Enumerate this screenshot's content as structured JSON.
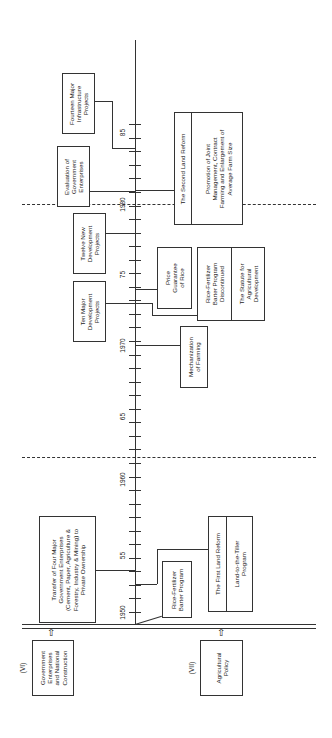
{
  "timeline": {
    "axis_labels": [
      {
        "text": "1950",
        "y": 612
      },
      {
        "text": "55",
        "y": 545
      },
      {
        "text": "1960",
        "y": 480
      },
      {
        "text": "65",
        "y": 415
      },
      {
        "text": "1970",
        "y": 346
      },
      {
        "text": "75",
        "y": 275
      },
      {
        "text": "1980",
        "y": 205
      },
      {
        "text": "85",
        "y": 133
      }
    ],
    "separator_years": [
      "1961",
      "1980"
    ]
  },
  "categories": {
    "vi": {
      "numeral": "(VI)",
      "label": "Government\nEnterprises\nand National\nConstruction"
    },
    "vii": {
      "numeral": "(VII)",
      "label": "Agricultural\nPolicy"
    }
  },
  "events_left": {
    "fourteen_projects": "Fourteen Major\nInfrastructure\nProjects",
    "evaluation": "Evaluation of\nGovernment\nEnterprises",
    "twelve_projects": "Twelve New\nDevelopment\nProjects",
    "ten_projects": "Ten Major\nDevelopment\nProjects",
    "transfer": "Transfer of Four Major\nGovernment Enterprises\n(Cement, Paper, Agriculture &\nForestry, Industry & Mining) to\nPrivate Ownership"
  },
  "events_right": {
    "second_reform_title": "The Second Land Reform",
    "second_reform_detail": "Promotion of Joint\nManagement, Contract\nFarming and Enlargement of\nAverage Farm Size",
    "price_guarantee": "Price\nGuarantee\nof Rice",
    "barter_discontinued": "Rice-Fertilizer\nBarter Program\nDiscontinued",
    "statute": "The Statute for\nAgricultural\nDevelopment",
    "mechanization": "Mechanization\nof Farming",
    "barter_program": "Rice-Fertilizer\nBarter Program",
    "first_reform_title": "The First Land Reform",
    "first_reform_detail": "Land-to-the-Tiller\nProgram"
  },
  "arrows": {
    "up": "⇧"
  }
}
